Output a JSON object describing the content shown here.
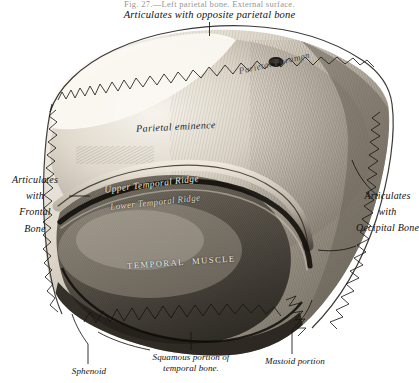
{
  "figure": {
    "caption_top": "Fig. 27.—Left parietal bone.  External surface.",
    "top_label": "Articulates with opposite parietal bone",
    "left_label_lines": [
      "Articulates",
      "with",
      "Frontal",
      "Bone"
    ],
    "right_label_lines": [
      "Articulates",
      "with",
      "Occipital Bone"
    ],
    "bottom_labels": {
      "squamous": "Squamous portion of\ntemporal bone.",
      "squamous_line1": "Squamous portion of",
      "squamous_line2": "temporal bone.",
      "mastoid": "Mastoid portion",
      "sphenoid": "Sphenoid"
    },
    "engraved_labels": {
      "parietal_eminence": "Parietal eminence",
      "parietal_foramen": "Parietal Foramen",
      "upper_temporal_ridge": "Upper Temporal Ridge",
      "lower_temporal_ridge": "Lower Temporal Ridge",
      "temporal_muscle": "TEMPORAL MUSCLE"
    }
  },
  "colors": {
    "page_background": "#ffffff",
    "ink": "#1a1a1a",
    "bone_light": "#efeae1",
    "bone_mid": "#b9b2a6",
    "bone_shadow": "#6e675d",
    "bone_dark": "#2e2a25",
    "suture_ink": "#1b1813"
  }
}
